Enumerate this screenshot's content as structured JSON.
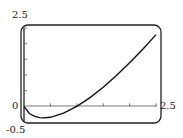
{
  "chart_data": {
    "type": "line",
    "title": "",
    "xlabel": "",
    "ylabel": "",
    "xlim": [
      0,
      2.5
    ],
    "ylim": [
      -0.5,
      2.5
    ],
    "x_tick_step": 0.5,
    "y_tick_step": 0.5,
    "grid": false,
    "series": [
      {
        "name": "curve",
        "x": [
          0.0,
          0.1,
          0.2,
          0.3,
          0.37,
          0.5,
          0.75,
          1.0,
          1.25,
          1.5,
          1.75,
          2.0,
          2.25,
          2.5
        ],
        "y": [
          0.0,
          -0.23,
          -0.32,
          -0.36,
          -0.37,
          -0.35,
          -0.22,
          0.0,
          0.28,
          0.61,
          0.98,
          1.39,
          1.82,
          2.29
        ]
      }
    ],
    "labels": {
      "ymax": "2.5",
      "ymin": "-0.5",
      "xmin": "0",
      "xmax": "2.5"
    }
  }
}
